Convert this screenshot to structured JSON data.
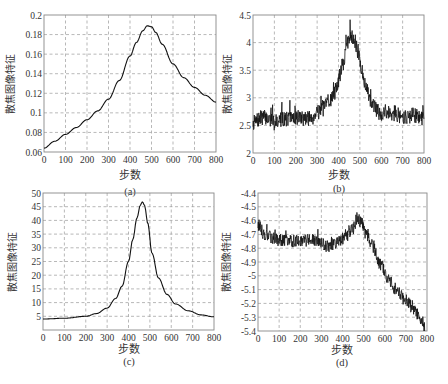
{
  "chart_data": [
    {
      "id": "a",
      "type": "line",
      "caption": "(a)",
      "xlabel": "步数",
      "ylabel": "散焦图像特征",
      "xlim": [
        0,
        800
      ],
      "ylim": [
        0.06,
        0.2
      ],
      "xticks": [
        0,
        100,
        200,
        300,
        400,
        500,
        600,
        700,
        800
      ],
      "xtick_labels": [
        "0",
        "100",
        "200",
        "300",
        "400",
        "500",
        "600",
        "700",
        "800"
      ],
      "yticks": [
        0.06,
        0.08,
        0.1,
        0.12,
        0.14,
        0.16,
        0.18,
        0.2
      ],
      "ytick_labels": [
        "0.06",
        "0.08",
        "0.1",
        "0.12",
        "0.14",
        "0.16",
        "0.18",
        "0.2"
      ],
      "grid": true,
      "noisy": false,
      "series": [
        {
          "name": "feature",
          "x": [
            0,
            50,
            100,
            150,
            200,
            250,
            300,
            350,
            400,
            430,
            460,
            480,
            500,
            520,
            550,
            600,
            650,
            700,
            750,
            800
          ],
          "y": [
            0.064,
            0.071,
            0.078,
            0.085,
            0.093,
            0.102,
            0.114,
            0.133,
            0.158,
            0.172,
            0.184,
            0.189,
            0.188,
            0.182,
            0.17,
            0.15,
            0.136,
            0.126,
            0.118,
            0.111
          ]
        }
      ]
    },
    {
      "id": "b",
      "type": "line",
      "caption": "(b)",
      "xlabel": "步数",
      "ylabel": "散焦图像特征",
      "xlim": [
        0,
        800
      ],
      "ylim": [
        2,
        4.5
      ],
      "xticks": [
        0,
        100,
        200,
        300,
        400,
        500,
        600,
        700,
        800
      ],
      "xtick_labels": [
        "0",
        "100",
        "200",
        "300",
        "400",
        "500",
        "600",
        "700",
        "800"
      ],
      "yticks": [
        2,
        2.5,
        3,
        3.5,
        4,
        4.5
      ],
      "ytick_labels": [
        "2",
        "2.5",
        "3",
        "3.5",
        "4",
        "4.5"
      ],
      "grid": true,
      "noisy": true,
      "noise_amplitude": 0.14,
      "seed": 7,
      "series": [
        {
          "name": "feature",
          "x": [
            0,
            50,
            100,
            150,
            200,
            250,
            280,
            300,
            330,
            360,
            380,
            400,
            420,
            440,
            455,
            470,
            490,
            510,
            530,
            560,
            600,
            650,
            700,
            750,
            800
          ],
          "y": [
            2.55,
            2.65,
            2.58,
            2.62,
            2.65,
            2.62,
            2.65,
            2.78,
            2.82,
            2.95,
            3.1,
            3.3,
            3.6,
            3.95,
            4.15,
            4.1,
            3.85,
            3.5,
            3.15,
            2.85,
            2.72,
            2.75,
            2.65,
            2.68,
            2.62
          ]
        }
      ]
    },
    {
      "id": "c",
      "type": "line",
      "caption": "(c)",
      "xlabel": "步数",
      "ylabel": "散焦图像特征",
      "xlim": [
        0,
        800
      ],
      "ylim": [
        0,
        50
      ],
      "xticks": [
        0,
        100,
        200,
        300,
        400,
        500,
        600,
        700,
        800
      ],
      "xtick_labels": [
        "0",
        "100",
        "200",
        "300",
        "400",
        "500",
        "600",
        "700",
        "800"
      ],
      "yticks": [
        5,
        10,
        15,
        20,
        25,
        30,
        35,
        40,
        45,
        50
      ],
      "ytick_labels": [
        "5",
        "10",
        "15",
        "20",
        "25",
        "30",
        "35",
        "40",
        "45",
        "50"
      ],
      "grid": true,
      "noisy": false,
      "series": [
        {
          "name": "feature",
          "x": [
            0,
            100,
            200,
            250,
            300,
            340,
            370,
            400,
            420,
            440,
            455,
            465,
            475,
            490,
            510,
            540,
            580,
            620,
            680,
            740,
            800
          ],
          "y": [
            4.0,
            4.3,
            5.0,
            6.0,
            8.0,
            11.5,
            16.0,
            25.0,
            33.0,
            41.0,
            45.5,
            46.8,
            45.5,
            39.0,
            28.0,
            19.0,
            13.0,
            9.5,
            7.0,
            5.5,
            4.8
          ]
        }
      ]
    },
    {
      "id": "d",
      "type": "line",
      "caption": "(d)",
      "xlabel": "步数",
      "ylabel": "散焦图像特征",
      "xlim": [
        0,
        800
      ],
      "ylim": [
        -5.4,
        -4.4
      ],
      "xticks": [
        0,
        100,
        200,
        300,
        400,
        500,
        600,
        700,
        800
      ],
      "xtick_labels": [
        "0",
        "100",
        "200",
        "300",
        "400",
        "500",
        "600",
        "700",
        "800"
      ],
      "yticks": [
        -5.4,
        -5.3,
        -5.2,
        -5.1,
        -5.0,
        -4.9,
        -4.8,
        -4.7,
        -4.6,
        -4.5,
        -4.4
      ],
      "ytick_labels": [
        "-5.4",
        "-5.3",
        "-5.2",
        "-5.1",
        "-5",
        "-4.9",
        "-4.8",
        "-4.7",
        "-4.6",
        "-4.5",
        "-4.4"
      ],
      "grid": true,
      "noisy": true,
      "noise_amplitude": 0.045,
      "seed": 13,
      "series": [
        {
          "name": "feature",
          "x": [
            0,
            30,
            60,
            100,
            150,
            200,
            250,
            300,
            330,
            360,
            390,
            420,
            450,
            470,
            490,
            510,
            540,
            580,
            620,
            660,
            700,
            740,
            770,
            790
          ],
          "y": [
            -4.63,
            -4.7,
            -4.72,
            -4.74,
            -4.75,
            -4.74,
            -4.74,
            -4.77,
            -4.79,
            -4.77,
            -4.74,
            -4.7,
            -4.66,
            -4.58,
            -4.62,
            -4.7,
            -4.78,
            -4.92,
            -5.03,
            -5.12,
            -5.18,
            -5.25,
            -5.31,
            -5.37
          ]
        }
      ]
    }
  ]
}
